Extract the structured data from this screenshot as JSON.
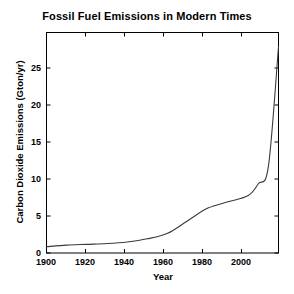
{
  "chart_data": {
    "type": "line",
    "title": "Fossil Fuel Emissions in Modern Times",
    "xlabel": "Year",
    "ylabel": "Carbon Dioxide Emissions (Gton/yr)",
    "xlim": [
      1900,
      2015
    ],
    "ylim": [
      0,
      28
    ],
    "xticks": [
      1900,
      1920,
      1940,
      1960,
      1980,
      2000
    ],
    "yticks": [
      0,
      5,
      10,
      15,
      20,
      25
    ],
    "xtick_labels": [
      "1900",
      "1920",
      "1940",
      "1960",
      "1980",
      "2000"
    ],
    "ytick_labels": [
      "0",
      "5",
      "10",
      "15",
      "20",
      "25"
    ],
    "grid": false,
    "legend": null,
    "line_color": "#3a3a3a",
    "background_color": "#ffffff",
    "axis_color": "#000000",
    "series": [
      {
        "name": "Fossil fuel CO2 emissions",
        "x": [
          1900,
          1910,
          1920,
          1930,
          1940,
          1950,
          1960,
          1970,
          1980,
          1990,
          2000,
          2005,
          2010,
          2015
        ],
        "values": [
          0.8,
          1.0,
          1.1,
          1.2,
          1.4,
          1.8,
          2.5,
          4.1,
          5.7,
          6.5,
          7.3,
          8.8,
          11.0,
          26.2
        ]
      }
    ]
  },
  "axes": {
    "title": "Fossil Fuel Emissions in Modern Times",
    "xlabel": "Year",
    "ylabel": "Carbon Dioxide Emissions (Gton/yr)",
    "ytick_labels": [
      "25",
      "20",
      "15",
      "10",
      "5",
      "0"
    ],
    "xtick_labels": [
      "1900",
      "1920",
      "1940",
      "1960",
      "1980",
      "2000"
    ]
  }
}
